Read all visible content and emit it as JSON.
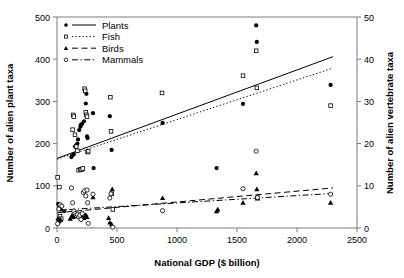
{
  "chart_data": {
    "type": "scatter",
    "title": "",
    "xlabel": "National GDP ($ billion)",
    "ylabel": "Number of alien plant taxa",
    "y2label": "Number of alien vertebrate taxa",
    "xlim": [
      0,
      2500
    ],
    "ylim": [
      0,
      500
    ],
    "y2lim": [
      0,
      50
    ],
    "xticks": [
      0,
      500,
      1000,
      1500,
      2000,
      2500
    ],
    "yticks": [
      0,
      100,
      200,
      300,
      400,
      500
    ],
    "y2ticks": [
      0,
      10,
      20,
      30,
      40,
      50
    ],
    "grid": false,
    "legend_position": "top-left",
    "series": [
      {
        "name": "Plants",
        "axis": "left",
        "marker": "filled-circle",
        "line_style": "solid",
        "points": [
          [
            10,
            57
          ],
          [
            20,
            50
          ],
          [
            30,
            44
          ],
          [
            60,
            40
          ],
          [
            120,
            168
          ],
          [
            130,
            172
          ],
          [
            140,
            175
          ],
          [
            150,
            193
          ],
          [
            160,
            196
          ],
          [
            170,
            200
          ],
          [
            175,
            210
          ],
          [
            185,
            232
          ],
          [
            195,
            240
          ],
          [
            200,
            245
          ],
          [
            210,
            247
          ],
          [
            225,
            253
          ],
          [
            240,
            295
          ],
          [
            245,
            318
          ],
          [
            250,
            217
          ],
          [
            255,
            213
          ],
          [
            300,
            272
          ],
          [
            305,
            142
          ],
          [
            440,
            265
          ],
          [
            455,
            185
          ],
          [
            880,
            249
          ],
          [
            1330,
            142
          ],
          [
            1550,
            294
          ],
          [
            1660,
            480
          ],
          [
            1665,
            441
          ],
          [
            2280,
            339
          ]
        ],
        "trend": {
          "x1": 0,
          "y1": 165,
          "x2": 2300,
          "y2": 406
        }
      },
      {
        "name": "Fish",
        "axis": "left",
        "marker": "open-square",
        "line_style": "dotted",
        "points": [
          [
            5,
            120
          ],
          [
            20,
            97
          ],
          [
            25,
            28
          ],
          [
            35,
            22
          ],
          [
            130,
            233
          ],
          [
            135,
            268
          ],
          [
            140,
            264
          ],
          [
            150,
            221
          ],
          [
            160,
            193
          ],
          [
            170,
            183
          ],
          [
            180,
            137
          ],
          [
            195,
            139
          ],
          [
            205,
            138
          ],
          [
            215,
            141
          ],
          [
            230,
            330
          ],
          [
            235,
            325
          ],
          [
            240,
            274
          ],
          [
            245,
            268
          ],
          [
            250,
            264
          ],
          [
            255,
            180
          ],
          [
            260,
            182
          ],
          [
            445,
            310
          ],
          [
            450,
            229
          ],
          [
            455,
            81
          ],
          [
            465,
            44
          ],
          [
            875,
            320
          ],
          [
            1550,
            361
          ],
          [
            1660,
            420
          ],
          [
            1665,
            332
          ],
          [
            1670,
            72
          ],
          [
            2280,
            290
          ]
        ],
        "trend": {
          "x1": 0,
          "y1": 163,
          "x2": 2300,
          "y2": 379
        }
      },
      {
        "name": "Birds",
        "axis": "right",
        "marker": "filled-triangle",
        "line_style": "dashed",
        "points": [
          [
            8,
            2.2
          ],
          [
            18,
            1.6
          ],
          [
            30,
            2.0
          ],
          [
            110,
            2.2
          ],
          [
            125,
            3.0
          ],
          [
            135,
            2.6
          ],
          [
            150,
            3.4
          ],
          [
            160,
            2.9
          ],
          [
            175,
            3.1
          ],
          [
            185,
            2.6
          ],
          [
            195,
            3.3
          ],
          [
            205,
            2.9
          ],
          [
            215,
            3.5
          ],
          [
            225,
            2.4
          ],
          [
            240,
            3.1
          ],
          [
            250,
            2.6
          ],
          [
            300,
            7.3
          ],
          [
            430,
            2.4
          ],
          [
            440,
            1.3
          ],
          [
            455,
            0.9
          ],
          [
            460,
            9.2
          ],
          [
            880,
            7.1
          ],
          [
            1330,
            4.0
          ],
          [
            1340,
            4.4
          ],
          [
            1550,
            6.0
          ],
          [
            1660,
            13.0
          ],
          [
            1665,
            9.2
          ],
          [
            1670,
            7.0
          ],
          [
            2280,
            6.0
          ]
        ],
        "trend": {
          "x1": 0,
          "y1": 3.6,
          "x2": 2300,
          "y2": 9.5
        }
      },
      {
        "name": "Mammals",
        "axis": "right",
        "marker": "open-circle",
        "line_style": "dash-dot",
        "points": [
          [
            5,
            1.0
          ],
          [
            15,
            4.5
          ],
          [
            25,
            5.5
          ],
          [
            40,
            5.2
          ],
          [
            120,
            9.5
          ],
          [
            130,
            6.0
          ],
          [
            140,
            4.0
          ],
          [
            150,
            3.4
          ],
          [
            160,
            3.0
          ],
          [
            170,
            3.2
          ],
          [
            180,
            2.6
          ],
          [
            190,
            3.0
          ],
          [
            200,
            2.0
          ],
          [
            210,
            3.4
          ],
          [
            220,
            8.4
          ],
          [
            230,
            8.8
          ],
          [
            240,
            7.6
          ],
          [
            250,
            9.0
          ],
          [
            255,
            6.0
          ],
          [
            260,
            1.1
          ],
          [
            300,
            8.0
          ],
          [
            440,
            7.1
          ],
          [
            450,
            8.1
          ],
          [
            465,
            0.2
          ],
          [
            880,
            4.1
          ],
          [
            1550,
            9.3
          ],
          [
            1660,
            18.2
          ],
          [
            1670,
            7.2
          ],
          [
            2280,
            8.0
          ]
        ],
        "trend": {
          "x1": 0,
          "y1": 4.2,
          "x2": 2300,
          "y2": 8.2
        }
      }
    ]
  },
  "legend": {
    "items": [
      {
        "label": "Plants"
      },
      {
        "label": "Fish"
      },
      {
        "label": "Birds"
      },
      {
        "label": "Mammals"
      }
    ]
  },
  "axes": {
    "x_title": "National GDP ($ billion)",
    "y_left_title": "Number of alien plant taxa",
    "y_right_title": "Number of alien vertebrate taxa",
    "x_tick_labels": [
      "0",
      "500",
      "1000",
      "1500",
      "2000",
      "2500"
    ],
    "y_left_tick_labels": [
      "0",
      "100",
      "200",
      "300",
      "400",
      "500"
    ],
    "y_right_tick_labels": [
      "0",
      "10",
      "20",
      "30",
      "40",
      "50"
    ]
  },
  "colors": {
    "ink": "#000000",
    "frame": "#7a7a7a",
    "background": "#ffffff"
  }
}
